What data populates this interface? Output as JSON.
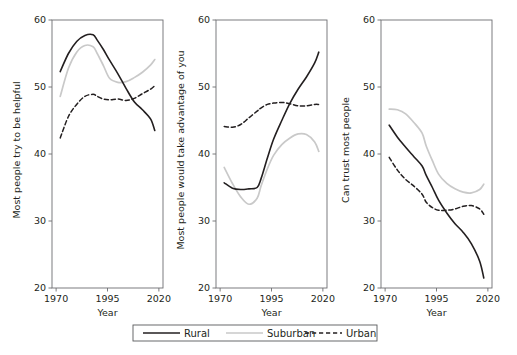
{
  "figure": {
    "width": 517,
    "height": 355,
    "background": "#ffffff",
    "panel_count": 3
  },
  "colors": {
    "rural": "#231f20",
    "suburban": "#c9c9c9",
    "urban": "#231f20",
    "frame": "#6d6e71",
    "text": "#231f20"
  },
  "legend": {
    "position": "bottom-center",
    "frame_color": "#58595b",
    "entries": [
      {
        "label": "Rural",
        "style": "solid",
        "color": "#231f20",
        "width": 1.6
      },
      {
        "label": "Suburban",
        "style": "solid",
        "color": "#c9c9c9",
        "width": 1.7
      },
      {
        "label": "Urban",
        "style": "dashed",
        "color": "#231f20",
        "width": 1.5
      }
    ]
  },
  "chart_data": [
    {
      "type": "line",
      "panel": 1,
      "title": "",
      "xlabel": "Year",
      "ylabel": "Most people try to be helpful",
      "xlim": [
        1968,
        2022
      ],
      "ylim": [
        20,
        60
      ],
      "xticks": [
        1970,
        1995,
        2020
      ],
      "xticklabels": [
        "1970",
        "1995",
        "2020"
      ],
      "yticks": [
        20,
        30,
        40,
        50,
        60
      ],
      "yticklabels": [
        "20",
        "30",
        "40",
        "50",
        "60"
      ],
      "grid": false,
      "x": [
        1972,
        1976,
        1980,
        1984,
        1988,
        1990,
        1993,
        1996,
        2000,
        2004,
        2008,
        2012,
        2016,
        2018
      ],
      "series": [
        {
          "name": "Rural",
          "style": "solid",
          "color": "#231f20",
          "values": [
            52.3,
            55.0,
            56.8,
            57.7,
            57.8,
            57.0,
            55.6,
            54.0,
            52.0,
            49.8,
            47.8,
            46.6,
            45.2,
            43.5
          ]
        },
        {
          "name": "Suburban",
          "style": "solid",
          "color": "#c9c9c9",
          "values": [
            48.6,
            52.8,
            55.2,
            56.2,
            56.0,
            55.0,
            53.2,
            51.3,
            50.7,
            50.8,
            51.4,
            52.2,
            53.3,
            54.1
          ]
        },
        {
          "name": "Urban",
          "style": "dashed",
          "color": "#231f20",
          "values": [
            42.4,
            45.6,
            47.4,
            48.6,
            48.9,
            48.6,
            48.2,
            48.1,
            48.2,
            48.0,
            48.3,
            49.0,
            49.7,
            50.2
          ]
        }
      ]
    },
    {
      "type": "line",
      "panel": 2,
      "title": "",
      "xlabel": "Year",
      "ylabel": "Most people would take advantage of you",
      "xlim": [
        1968,
        2022
      ],
      "ylim": [
        20,
        60
      ],
      "xticks": [
        1970,
        1995,
        2020
      ],
      "xticklabels": [
        "1970",
        "1995",
        "2020"
      ],
      "yticks": [
        20,
        30,
        40,
        50,
        60
      ],
      "yticklabels": [
        "20",
        "30",
        "40",
        "50",
        "60"
      ],
      "grid": false,
      "x": [
        1972,
        1976,
        1980,
        1984,
        1988,
        1990,
        1993,
        1996,
        2000,
        2004,
        2008,
        2012,
        2016,
        2018
      ],
      "series": [
        {
          "name": "Rural",
          "style": "solid",
          "color": "#231f20",
          "values": [
            35.7,
            34.9,
            34.7,
            34.8,
            35.0,
            36.4,
            39.4,
            42.2,
            45.0,
            47.6,
            49.7,
            51.5,
            53.6,
            55.2
          ]
        },
        {
          "name": "Suburban",
          "style": "solid",
          "color": "#c9c9c9",
          "values": [
            38.0,
            35.6,
            33.6,
            32.5,
            33.4,
            35.3,
            37.8,
            39.8,
            41.4,
            42.4,
            43.0,
            42.9,
            41.8,
            40.4
          ]
        },
        {
          "name": "Urban",
          "style": "dashed",
          "color": "#231f20",
          "values": [
            44.1,
            44.0,
            44.4,
            45.4,
            46.4,
            46.9,
            47.4,
            47.6,
            47.7,
            47.5,
            47.2,
            47.2,
            47.4,
            47.4
          ]
        }
      ]
    },
    {
      "type": "line",
      "panel": 3,
      "title": "",
      "xlabel": "Year",
      "ylabel": "Can trust most people",
      "xlim": [
        1968,
        2022
      ],
      "ylim": [
        20,
        60
      ],
      "xticks": [
        1970,
        1995,
        2020
      ],
      "xticklabels": [
        "1970",
        "1995",
        "2020"
      ],
      "yticks": [
        20,
        30,
        40,
        50,
        60
      ],
      "yticklabels": [
        "20",
        "30",
        "40",
        "50",
        "60"
      ],
      "grid": false,
      "x": [
        1972,
        1976,
        1980,
        1984,
        1988,
        1990,
        1993,
        1996,
        2000,
        2004,
        2008,
        2012,
        2016,
        2018
      ],
      "series": [
        {
          "name": "Rural",
          "style": "solid",
          "color": "#231f20",
          "values": [
            44.3,
            42.5,
            41.0,
            39.6,
            38.2,
            36.8,
            35.0,
            33.1,
            31.2,
            29.6,
            28.3,
            26.6,
            24.0,
            21.5
          ]
        },
        {
          "name": "Suburban",
          "style": "solid",
          "color": "#c9c9c9",
          "values": [
            46.7,
            46.6,
            46.0,
            44.7,
            43.1,
            41.2,
            39.0,
            37.0,
            35.6,
            34.8,
            34.3,
            34.2,
            34.7,
            35.5
          ]
        },
        {
          "name": "Urban",
          "style": "dashed",
          "color": "#231f20",
          "values": [
            39.5,
            37.6,
            36.2,
            35.2,
            34.0,
            32.8,
            32.0,
            31.6,
            31.6,
            31.8,
            32.2,
            32.3,
            31.8,
            31.0
          ]
        }
      ]
    }
  ]
}
